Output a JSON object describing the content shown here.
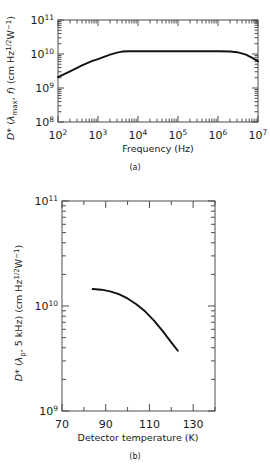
{
  "figure": {
    "panels": [
      {
        "id": "a",
        "panel_label": "(a)",
        "chart_data": {
          "type": "line",
          "title": "",
          "xlabel": "Frequency (Hz)",
          "ylabel": "D* (λmax, f) (cm Hz1/2 W−1)",
          "ylabel_parts": {
            "symbol": "D*",
            "args_open": " (",
            "arg_italic": "λ",
            "arg_sub": "max",
            "arg_rest": ", ",
            "arg_italic2": "f",
            "args_close": ")",
            "units_open": " (cm Hz",
            "units_sup1": "1/2",
            "units_mid": "W",
            "units_sup2": "−1",
            "units_close": ")"
          },
          "xscale": "log",
          "yscale": "log",
          "xlim": [
            100,
            10000000
          ],
          "ylim": [
            100000000,
            100000000000
          ],
          "grid": false,
          "legend": null,
          "xticks": [
            100,
            1000,
            10000,
            100000,
            1000000,
            10000000
          ],
          "xtick_labels": [
            "10 2",
            "10 3",
            "10 4",
            "10 5",
            "10 6",
            "10 7"
          ],
          "xtick_mantissas": [
            "10",
            "10",
            "10",
            "10",
            "10",
            "10"
          ],
          "xtick_exponents": [
            "2",
            "3",
            "4",
            "5",
            "6",
            "7"
          ],
          "yticks": [
            100000000,
            1000000000,
            10000000000,
            100000000000
          ],
          "ytick_mantissas": [
            "10",
            "10",
            "10",
            "10"
          ],
          "ytick_exponents": [
            "8",
            "9",
            "10",
            "11"
          ],
          "minor_ticks": true,
          "series": [
            {
              "name": "D* vs frequency",
              "x": [
                100,
                200,
                400,
                700,
                1000,
                2000,
                3000,
                4000,
                6000,
                10000,
                100000,
                1000000,
                2000000,
                3000000,
                5000000,
                7000000,
                10000000
              ],
              "y": [
                2100000000,
                3100000000,
                4600000000,
                6200000000,
                7100000000,
                9600000000,
                11000000000,
                11800000000,
                12000000000,
                12000000000,
                12000000000,
                12000000000,
                11800000000,
                11300000000,
                9600000000,
                7800000000,
                6100000000
              ]
            }
          ]
        }
      },
      {
        "id": "b",
        "panel_label": "(b)",
        "chart_data": {
          "type": "line",
          "title": "",
          "xlabel": "Detector temperature (K)",
          "ylabel": "D* (λp, 5 kHz) (cm Hz1/2 W−1)",
          "ylabel_parts": {
            "symbol": "D*",
            "args_open": " (",
            "arg_italic": "λ",
            "arg_sub": "p",
            "arg_rest": ", 5 kHz)",
            "units_open": " (cm Hz",
            "units_sup1": "1/2",
            "units_mid": "W",
            "units_sup2": "−1",
            "units_close": ")"
          },
          "xscale": "linear",
          "yscale": "log",
          "xlim": [
            70,
            140
          ],
          "ylim": [
            1000000000,
            100000000000
          ],
          "grid": false,
          "legend": null,
          "xticks": [
            70,
            90,
            110,
            130
          ],
          "xtick_labels": [
            "70",
            "90",
            "110",
            "130"
          ],
          "xminor_ticks": [
            80,
            100,
            120,
            140
          ],
          "yticks": [
            1000000000,
            10000000000,
            100000000000
          ],
          "ytick_mantissas": [
            "10",
            "10",
            "10"
          ],
          "ytick_exponents": [
            "9",
            "10",
            "11"
          ],
          "minor_ticks": true,
          "series": [
            {
              "name": "D* vs detector temperature",
              "x": [
                84,
                88,
                92,
                96,
                100,
                104,
                108,
                112,
                116,
                120,
                123
              ],
              "y": [
                14500000000,
                14300000000,
                13800000000,
                13000000000,
                11800000000,
                10400000000,
                8900000000,
                7300000000,
                5800000000,
                4500000000,
                3750000000
              ]
            }
          ]
        }
      }
    ]
  }
}
